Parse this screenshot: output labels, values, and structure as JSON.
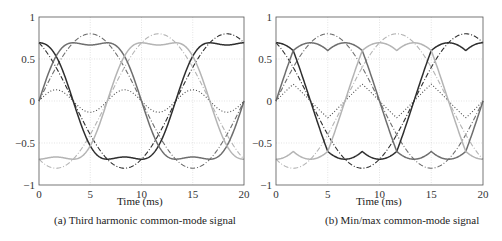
{
  "figure": {
    "panels": [
      {
        "caption": "(a) Third harmonic common-mode signal",
        "xlabel": "Time (ms)"
      },
      {
        "caption": "(b) Min/max common-mode signal",
        "xlabel": "Time (ms)"
      }
    ],
    "colors": {
      "phase_a": "#2e2e2e",
      "phase_b": "#6e6e6e",
      "phase_c": "#b4b4b4",
      "common_mode": "#4a4a4a",
      "grid": "#d8d8d8",
      "axis": "#555555"
    }
  },
  "chart_data": [
    {
      "type": "line",
      "title": "(a) Third harmonic common-mode signal",
      "xlabel": "Time (ms)",
      "ylabel": "",
      "xlim": [
        0,
        20
      ],
      "ylim": [
        -1,
        1
      ],
      "xticks": [
        0,
        5,
        10,
        15,
        20
      ],
      "yticks": [
        -1,
        -0.5,
        0,
        0.5,
        1
      ],
      "ytick_labels": [
        "−1",
        "−0.5",
        "0",
        "0.5",
        "1"
      ],
      "grid": true,
      "legend": null,
      "x": [
        0,
        1,
        2,
        3,
        4,
        5,
        6,
        7,
        8,
        9,
        10,
        11,
        12,
        13,
        14,
        15,
        16,
        17,
        18,
        19,
        20
      ],
      "model": {
        "amplitude": 0.8,
        "frequency_hz": 50,
        "common_mode": "third_harmonic",
        "third_harmonic_amplitude": 0.1333
      },
      "series": [
        {
          "name": "reference phase a",
          "style": "dashdot",
          "color": "phase_a",
          "phase_deg": 120,
          "values": [
            0.693,
            0.535,
            0.325,
            0.084,
            -0.166,
            -0.4,
            -0.595,
            -0.731,
            -0.796,
            -0.782,
            -0.693,
            -0.535,
            -0.325,
            -0.084,
            0.166,
            0.4,
            0.595,
            0.731,
            0.796,
            0.782,
            0.693
          ]
        },
        {
          "name": "reference phase b",
          "style": "dashdot",
          "color": "phase_b",
          "phase_deg": 0,
          "values": [
            0,
            0.247,
            0.47,
            0.647,
            0.761,
            0.8,
            0.761,
            0.647,
            0.47,
            0.247,
            0,
            -0.247,
            -0.47,
            -0.647,
            -0.761,
            -0.8,
            -0.761,
            -0.647,
            -0.47,
            -0.247,
            0
          ]
        },
        {
          "name": "reference phase c",
          "style": "dashdot",
          "color": "phase_c",
          "phase_deg": -120,
          "values": [
            -0.693,
            -0.782,
            -0.796,
            -0.731,
            -0.595,
            -0.4,
            -0.166,
            0.084,
            0.325,
            0.535,
            0.693,
            0.782,
            0.796,
            0.731,
            0.595,
            0.4,
            0.166,
            -0.084,
            -0.325,
            -0.535,
            -0.693
          ]
        },
        {
          "name": "common-mode signal",
          "style": "dotted",
          "color": "common_mode",
          "values": [
            0,
            0.108,
            0.127,
            0.041,
            -0.078,
            -0.133,
            -0.078,
            0.041,
            0.127,
            0.108,
            0,
            -0.108,
            -0.127,
            -0.041,
            0.078,
            0.133,
            0.078,
            -0.041,
            -0.127,
            -0.108,
            0
          ]
        },
        {
          "name": "modulated phase a",
          "style": "solid",
          "color": "phase_a",
          "phase_deg": 120,
          "values": [
            0.693,
            0.643,
            0.452,
            0.125,
            -0.244,
            -0.533,
            -0.673,
            -0.69,
            -0.669,
            -0.674,
            -0.693,
            -0.643,
            -0.452,
            -0.125,
            0.244,
            0.533,
            0.673,
            0.69,
            0.669,
            0.674,
            0.693
          ]
        },
        {
          "name": "modulated phase b",
          "style": "solid",
          "color": "phase_b",
          "phase_deg": 0,
          "values": [
            0,
            0.355,
            0.597,
            0.688,
            0.683,
            0.667,
            0.683,
            0.688,
            0.597,
            0.355,
            0,
            -0.355,
            -0.597,
            -0.688,
            -0.683,
            -0.667,
            -0.683,
            -0.688,
            -0.597,
            -0.355,
            0
          ]
        },
        {
          "name": "modulated phase c",
          "style": "solid",
          "color": "phase_c",
          "phase_deg": -120,
          "values": [
            -0.693,
            -0.674,
            -0.669,
            -0.69,
            -0.673,
            -0.533,
            -0.244,
            0.125,
            0.452,
            0.643,
            0.693,
            0.674,
            0.669,
            0.69,
            0.673,
            0.533,
            0.244,
            -0.125,
            -0.452,
            -0.643,
            -0.693
          ]
        }
      ]
    },
    {
      "type": "line",
      "title": "(b) Min/max common-mode signal",
      "xlabel": "Time (ms)",
      "ylabel": "",
      "xlim": [
        0,
        20
      ],
      "ylim": [
        -1,
        1
      ],
      "xticks": [
        0,
        5,
        10,
        15,
        20
      ],
      "yticks": [
        -1,
        -0.5,
        0,
        0.5,
        1
      ],
      "ytick_labels": [
        "−1",
        "−0.5",
        "0",
        "0.5",
        "1"
      ],
      "grid": true,
      "legend": null,
      "x": [
        0,
        1,
        2,
        3,
        4,
        5,
        6,
        7,
        8,
        9,
        10,
        11,
        12,
        13,
        14,
        15,
        16,
        17,
        18,
        19,
        20
      ],
      "model": {
        "amplitude": 0.8,
        "frequency_hz": 50,
        "common_mode": "min_max"
      },
      "series": [
        {
          "name": "reference phase a",
          "style": "dashdot",
          "color": "phase_a",
          "phase_deg": 120,
          "values": [
            0.693,
            0.535,
            0.325,
            0.084,
            -0.166,
            -0.4,
            -0.595,
            -0.731,
            -0.796,
            -0.782,
            -0.693,
            -0.535,
            -0.325,
            -0.084,
            0.166,
            0.4,
            0.595,
            0.731,
            0.796,
            0.782,
            0.693
          ]
        },
        {
          "name": "reference phase b",
          "style": "dashdot",
          "color": "phase_b",
          "phase_deg": 0,
          "values": [
            0,
            0.247,
            0.47,
            0.647,
            0.761,
            0.8,
            0.761,
            0.647,
            0.47,
            0.247,
            0,
            -0.247,
            -0.47,
            -0.647,
            -0.761,
            -0.8,
            -0.761,
            -0.647,
            -0.47,
            -0.247,
            0
          ]
        },
        {
          "name": "reference phase c",
          "style": "dashdot",
          "color": "phase_c",
          "phase_deg": -120,
          "values": [
            -0.693,
            -0.782,
            -0.796,
            -0.731,
            -0.595,
            -0.4,
            -0.166,
            0.084,
            0.325,
            0.535,
            0.693,
            0.782,
            0.796,
            0.731,
            0.595,
            0.4,
            0.166,
            -0.084,
            -0.325,
            -0.535,
            -0.693
          ]
        },
        {
          "name": "common-mode signal",
          "style": "dotted",
          "color": "common_mode",
          "values": [
            0,
            0.124,
            0.163,
            0.042,
            -0.083,
            -0.2,
            -0.083,
            0.042,
            0.163,
            0.124,
            0,
            -0.124,
            -0.163,
            -0.042,
            0.083,
            0.2,
            0.083,
            -0.042,
            -0.163,
            -0.124,
            0
          ]
        },
        {
          "name": "modulated phase a",
          "style": "solid",
          "color": "phase_a",
          "phase_deg": 120,
          "values": [
            0.693,
            0.659,
            0.488,
            0.126,
            -0.249,
            -0.6,
            -0.678,
            -0.689,
            -0.633,
            -0.658,
            -0.693,
            -0.659,
            -0.488,
            -0.126,
            0.249,
            0.6,
            0.678,
            0.689,
            0.633,
            0.658,
            0.693
          ]
        },
        {
          "name": "modulated phase b",
          "style": "solid",
          "color": "phase_b",
          "phase_deg": 0,
          "values": [
            0,
            0.371,
            0.633,
            0.689,
            0.678,
            0.6,
            0.678,
            0.689,
            0.633,
            0.371,
            0,
            -0.371,
            -0.633,
            -0.689,
            -0.678,
            -0.6,
            -0.678,
            -0.689,
            -0.633,
            -0.371,
            0
          ]
        },
        {
          "name": "modulated phase c",
          "style": "solid",
          "color": "phase_c",
          "phase_deg": -120,
          "values": [
            -0.693,
            -0.658,
            -0.633,
            -0.689,
            -0.678,
            -0.6,
            -0.249,
            0.126,
            0.488,
            0.659,
            0.693,
            0.658,
            0.633,
            0.689,
            0.678,
            0.6,
            0.249,
            -0.126,
            -0.488,
            -0.659,
            -0.693
          ]
        }
      ]
    }
  ]
}
